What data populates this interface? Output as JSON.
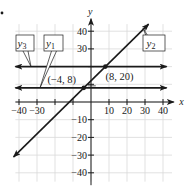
{
  "figure": {
    "marker_dot": true
  },
  "chart_data": {
    "type": "line",
    "title": "",
    "xlabel": "x",
    "ylabel": "y",
    "xlim": [
      -45,
      45
    ],
    "ylim": [
      -45,
      45
    ],
    "grid": true,
    "x_ticks": [
      -40,
      -30,
      -20,
      -10,
      10,
      20,
      30,
      40
    ],
    "x_tick_labels": [
      "-40",
      "-30",
      "",
      "",
      "10",
      "20",
      "30",
      "40"
    ],
    "y_ticks": [
      40,
      30,
      20,
      10,
      -10,
      -20,
      -30,
      -40
    ],
    "y_tick_labels": [
      "40",
      "30",
      "",
      "",
      "-10",
      "-20",
      "-30",
      "-40"
    ],
    "series": [
      {
        "name": "y1",
        "label_main": "y",
        "label_sub": "1",
        "kind": "horizontal",
        "equation": "y = 8",
        "x": [
          -42,
          42
        ],
        "y": [
          8,
          8
        ]
      },
      {
        "name": "y2",
        "label_main": "y",
        "label_sub": "2",
        "kind": "slope",
        "equation": "y = x + 12",
        "x": [
          -43,
          32
        ],
        "y": [
          -31,
          44
        ]
      },
      {
        "name": "y3",
        "label_main": "y",
        "label_sub": "3",
        "kind": "horizontal",
        "equation": "y = 20",
        "x": [
          -42,
          42
        ],
        "y": [
          20,
          20
        ]
      }
    ],
    "annotations": [
      {
        "text": "(−4, 8)",
        "x": -4,
        "y": 8
      },
      {
        "text": "(8, 20)",
        "x": 8,
        "y": 20
      }
    ],
    "legend": "callout boxes"
  }
}
